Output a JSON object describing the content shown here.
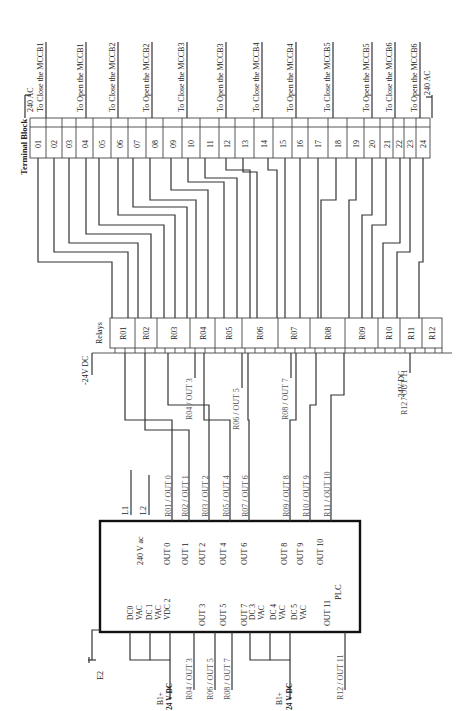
{
  "diagram": {
    "terminal_block": {
      "title": "Terminal Block",
      "terminals": [
        "01",
        "02",
        "03",
        "04",
        "05",
        "06",
        "07",
        "08",
        "09",
        "10",
        "11",
        "12",
        "13",
        "14",
        "15",
        "16",
        "17",
        "18",
        "19",
        "20",
        "21",
        "22",
        "23",
        "24"
      ],
      "top_labels": [
        {
          "text": "240 AC"
        },
        {
          "text": "To Close the MCCB1"
        },
        {
          "text": "To Open the MCCB1"
        },
        {
          "text": "To Close the MCCB2"
        },
        {
          "text": "To Open the MCCB2"
        },
        {
          "text": "To Close the MCCB3"
        },
        {
          "text": "To Open the MCCB3"
        },
        {
          "text": "To Close the MCCB4"
        },
        {
          "text": "To Open the MCCB4"
        },
        {
          "text": "To Close the MCCB5"
        },
        {
          "text": "To Open the MCCB5"
        },
        {
          "text": "To Close the MCCB6"
        },
        {
          "text": "To Open the MCCB6"
        },
        {
          "text": "240 AC"
        }
      ]
    },
    "relays": {
      "title": "Relays",
      "items": [
        "R01",
        "R02",
        "R03",
        "R04",
        "R05",
        "R06",
        "R07",
        "R08",
        "R09",
        "R10",
        "R11",
        "R12"
      ],
      "supply_left": "-24V DC",
      "supply_right": "-24V DC"
    },
    "relay_output_labels": {
      "upper": [
        "R04 / OUT 3",
        "R06 / OUT 5",
        "R08 / OUT 7",
        "R12 / OUT 11"
      ],
      "lower": [
        "R01 / OUT 0",
        "R02 / OUT 1",
        "R03 / OUT 2",
        "R05 / OUT 4",
        "R07 / OUT 6",
        "R09 / OUT 8",
        "R10 / OUT 9",
        "R11 / OUT 10"
      ],
      "bottom": [
        "R04 / OUT 3",
        "R06 / OUT 5",
        "R08 / OUT 7",
        "R12 / OUT 11"
      ]
    },
    "plc": {
      "title": "PLC",
      "supply_label": "240 V ac",
      "line_labels": [
        "L1",
        "L2"
      ],
      "outputs_top": [
        "OUT 0",
        "OUT 1",
        "OUT 2",
        "OUT 4",
        "OUT 6",
        "OUT 8",
        "OUT 9",
        "OUT 10"
      ],
      "outputs_bottom": [
        "OUT 3",
        "OUT 5",
        "OUT 7",
        "OUT 11"
      ],
      "common_labels": [
        "DC0",
        "VAC",
        "DC 1",
        "VAC",
        "VDC 2",
        "DC 3",
        "VAC",
        "DC 4",
        "VAC",
        "DC 5",
        "VAC"
      ],
      "battery_labels": [
        "B1+",
        "24 V DC"
      ],
      "earth_label": "E2"
    }
  }
}
